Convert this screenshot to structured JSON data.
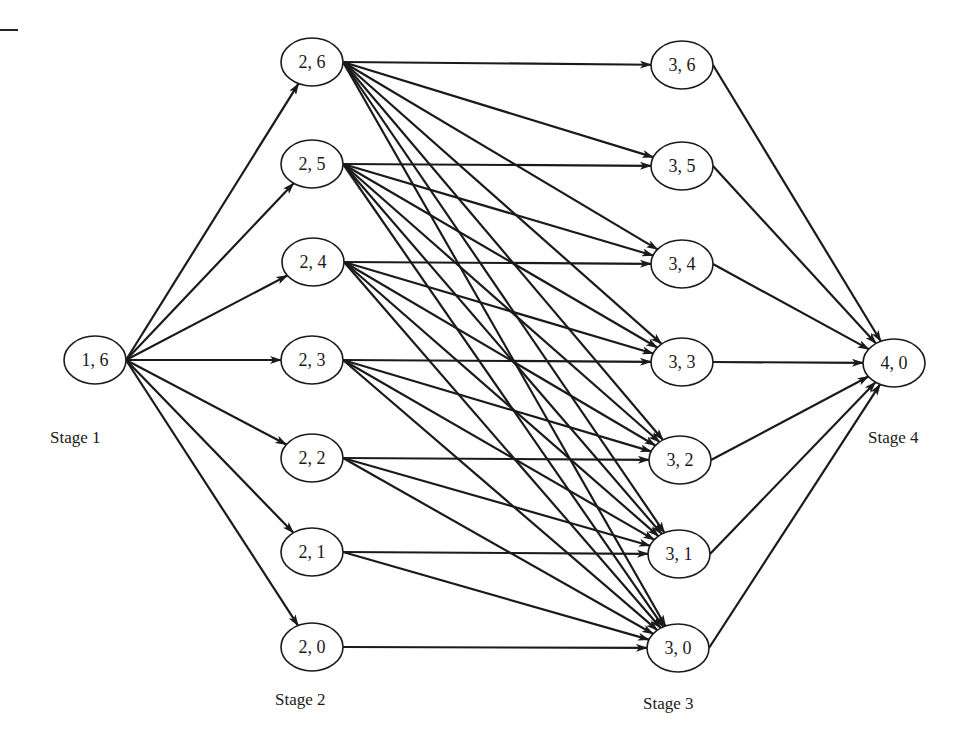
{
  "diagram": {
    "type": "staged-network",
    "stages": [
      {
        "id": "stage1",
        "label": "Stage 1",
        "label_pos": [
          50,
          444
        ]
      },
      {
        "id": "stage2",
        "label": "Stage 2",
        "label_pos": [
          275,
          706
        ]
      },
      {
        "id": "stage3",
        "label": "Stage 3",
        "label_pos": [
          643,
          710
        ]
      },
      {
        "id": "stage4",
        "label": "Stage 4",
        "label_pos": [
          868,
          444
        ]
      }
    ],
    "nodes": [
      {
        "id": "1,6",
        "label": "1, 6",
        "cx": 95,
        "cy": 360
      },
      {
        "id": "2,6",
        "label": "2, 6",
        "cx": 312,
        "cy": 62
      },
      {
        "id": "2,5",
        "label": "2, 5",
        "cx": 312,
        "cy": 164
      },
      {
        "id": "2,4",
        "label": "2, 4",
        "cx": 313,
        "cy": 262
      },
      {
        "id": "2,3",
        "label": "2, 3",
        "cx": 312,
        "cy": 360
      },
      {
        "id": "2,2",
        "label": "2, 2",
        "cx": 312,
        "cy": 458
      },
      {
        "id": "2,1",
        "label": "2, 1",
        "cx": 312,
        "cy": 552
      },
      {
        "id": "2,0",
        "label": "2, 0",
        "cx": 312,
        "cy": 647
      },
      {
        "id": "3,6",
        "label": "3, 6",
        "cx": 682,
        "cy": 65
      },
      {
        "id": "3,5",
        "label": "3, 5",
        "cx": 682,
        "cy": 166
      },
      {
        "id": "3,4",
        "label": "3, 4",
        "cx": 682,
        "cy": 264
      },
      {
        "id": "3,3",
        "label": "3, 3",
        "cx": 682,
        "cy": 362
      },
      {
        "id": "3,2",
        "label": "3, 2",
        "cx": 680,
        "cy": 460
      },
      {
        "id": "3,1",
        "label": "3, 1",
        "cx": 679,
        "cy": 554
      },
      {
        "id": "3,0",
        "label": "3, 0",
        "cx": 678,
        "cy": 648
      },
      {
        "id": "4,0",
        "label": "4, 0",
        "cx": 894,
        "cy": 363
      }
    ],
    "node_rx": 31,
    "node_ry": 24,
    "edges": [
      [
        "1,6",
        "2,6"
      ],
      [
        "1,6",
        "2,5"
      ],
      [
        "1,6",
        "2,4"
      ],
      [
        "1,6",
        "2,3"
      ],
      [
        "1,6",
        "2,2"
      ],
      [
        "1,6",
        "2,1"
      ],
      [
        "1,6",
        "2,0"
      ],
      [
        "2,6",
        "3,6"
      ],
      [
        "2,6",
        "3,5"
      ],
      [
        "2,6",
        "3,4"
      ],
      [
        "2,6",
        "3,3"
      ],
      [
        "2,6",
        "3,2"
      ],
      [
        "2,6",
        "3,1"
      ],
      [
        "2,6",
        "3,0"
      ],
      [
        "2,5",
        "3,5"
      ],
      [
        "2,5",
        "3,4"
      ],
      [
        "2,5",
        "3,3"
      ],
      [
        "2,5",
        "3,2"
      ],
      [
        "2,5",
        "3,1"
      ],
      [
        "2,5",
        "3,0"
      ],
      [
        "2,4",
        "3,4"
      ],
      [
        "2,4",
        "3,3"
      ],
      [
        "2,4",
        "3,2"
      ],
      [
        "2,4",
        "3,1"
      ],
      [
        "2,4",
        "3,0"
      ],
      [
        "2,3",
        "3,3"
      ],
      [
        "2,3",
        "3,2"
      ],
      [
        "2,3",
        "3,1"
      ],
      [
        "2,3",
        "3,0"
      ],
      [
        "2,2",
        "3,2"
      ],
      [
        "2,2",
        "3,1"
      ],
      [
        "2,2",
        "3,0"
      ],
      [
        "2,1",
        "3,1"
      ],
      [
        "2,1",
        "3,0"
      ],
      [
        "2,0",
        "3,0"
      ],
      [
        "3,6",
        "4,0"
      ],
      [
        "3,5",
        "4,0"
      ],
      [
        "3,4",
        "4,0"
      ],
      [
        "3,3",
        "4,0"
      ],
      [
        "3,2",
        "4,0"
      ],
      [
        "3,1",
        "4,0"
      ],
      [
        "3,0",
        "4,0"
      ]
    ],
    "colors": {
      "stroke": "#1a1a1a",
      "background": "#ffffff"
    }
  }
}
